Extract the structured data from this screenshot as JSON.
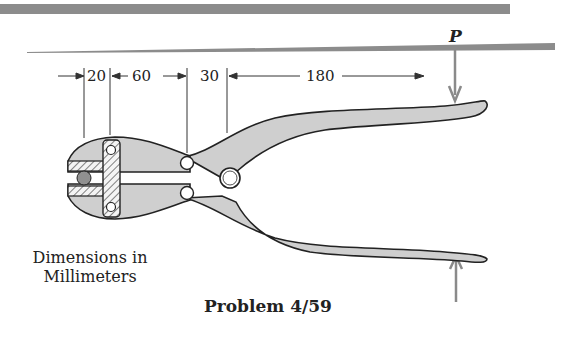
{
  "figure": {
    "caption": "Problem 4/59",
    "units_note_line1": "Dimensions in",
    "units_note_line2": "Millimeters",
    "force_label": "P",
    "dimensions": [
      {
        "id": "d1",
        "value": "20"
      },
      {
        "id": "d2",
        "value": "60"
      },
      {
        "id": "d3",
        "value": "30"
      },
      {
        "id": "d4",
        "value": "180"
      }
    ],
    "colors": {
      "part_fill": "#cfcfcf",
      "outline": "#222222",
      "band": "#8c8c8c",
      "force_arrow": "#8a8a8a",
      "workpiece": "#909090"
    }
  }
}
